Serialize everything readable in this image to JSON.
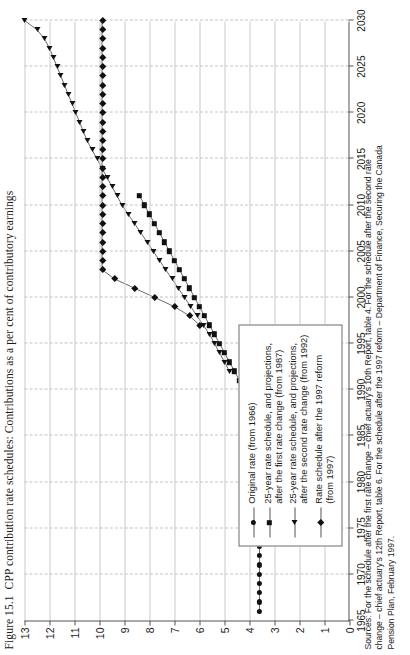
{
  "figure": {
    "number": "Figure 15.1",
    "title": "CPP contribution rate schedules: Contributions as a per cent of contributory earnings"
  },
  "sources": {
    "line1": "Sources: For the schedule after the first rate change – chief actuary's 10th Report, table 4. For the schedule after the second rate",
    "line2": "change – chief actuary's 12th Report, table 6. For the schedule after the 1997 reform – Department of Finance, Securing the Canada",
    "line3": "Pension Plan, February 1997."
  },
  "legend": {
    "items": [
      {
        "marker": "circle",
        "label": "Original rate (from 1966)"
      },
      {
        "marker": "square",
        "label": "25-year rate schedule, and projections,\nafter the first rate change (from 1987)"
      },
      {
        "marker": "triangle",
        "label": "25-year rate schedule, and projections,\nafter the second rate change (from 1992)"
      },
      {
        "marker": "diamond",
        "label": "Rate schedule after the 1997 reform\n(from 1997)"
      }
    ]
  },
  "chart_data": {
    "type": "line",
    "title": "CPP contribution rate schedules: Contributions as a per cent of contributory earnings",
    "xlabel": "",
    "ylabel": "",
    "xlim": [
      1965,
      2030
    ],
    "ylim": [
      0,
      13
    ],
    "xticks": [
      1965,
      1970,
      1975,
      1980,
      1985,
      1990,
      1995,
      2000,
      2005,
      2010,
      2015,
      2020,
      2025,
      2030
    ],
    "yticks": [
      0,
      1,
      2,
      3,
      4,
      5,
      6,
      7,
      8,
      9,
      10,
      11,
      12,
      13
    ],
    "grid": "both",
    "legend_position": "lower-left",
    "series": [
      {
        "name": "Original rate (from 1966)",
        "marker": "circle",
        "x": [
          1966,
          1967,
          1968,
          1969,
          1970,
          1971,
          1972,
          1973,
          1974,
          1975,
          1976,
          1977,
          1978,
          1979,
          1980,
          1981,
          1982,
          1983,
          1984,
          1985,
          1986
        ],
        "values": [
          3.6,
          3.6,
          3.6,
          3.6,
          3.6,
          3.6,
          3.6,
          3.6,
          3.6,
          3.6,
          3.6,
          3.6,
          3.6,
          3.6,
          3.6,
          3.6,
          3.6,
          3.6,
          3.6,
          3.6,
          3.6
        ]
      },
      {
        "name": "25-year rate schedule, and projections, after the first rate change (from 1987)",
        "marker": "square",
        "x": [
          1987,
          1988,
          1989,
          1990,
          1991,
          1992,
          1993,
          1994,
          1995,
          1996,
          1997,
          1998,
          1999,
          2000,
          2001,
          2002,
          2003,
          2004,
          2005,
          2006,
          2007,
          2008,
          2009,
          2010,
          2011
        ],
        "values": [
          3.8,
          3.8,
          4.0,
          4.2,
          4.4,
          4.6,
          4.8,
          5.0,
          5.2,
          5.4,
          5.6,
          5.8,
          6.0,
          6.2,
          6.4,
          6.6,
          6.8,
          7.0,
          7.2,
          7.4,
          7.6,
          7.8,
          8.0,
          8.2,
          8.4
        ]
      },
      {
        "name": "25-year rate schedule, and projections, after the second rate change (from 1992)",
        "marker": "triangle",
        "x": [
          1992,
          1993,
          1994,
          1995,
          1996,
          1997,
          1998,
          1999,
          2000,
          2001,
          2002,
          2003,
          2004,
          2005,
          2006,
          2007,
          2008,
          2009,
          2010,
          2011,
          2012,
          2013,
          2014,
          2015,
          2016,
          2017,
          2018,
          2019,
          2020,
          2021,
          2022,
          2023,
          2024,
          2025,
          2026,
          2027,
          2028,
          2029,
          2030
        ],
        "values": [
          4.8,
          5.0,
          5.2,
          5.4,
          5.6,
          5.85,
          6.1,
          6.35,
          6.6,
          6.85,
          7.1,
          7.35,
          7.6,
          7.85,
          8.1,
          8.35,
          8.6,
          8.85,
          9.1,
          9.3,
          9.5,
          9.7,
          9.9,
          10.1,
          10.3,
          10.5,
          10.65,
          10.8,
          10.95,
          11.1,
          11.25,
          11.4,
          11.55,
          11.7,
          11.85,
          12.0,
          12.2,
          12.5,
          13.0
        ]
      },
      {
        "name": "Rate schedule after the 1997 reform (from 1997)",
        "marker": "diamond",
        "x": [
          1997,
          1998,
          1999,
          2000,
          2001,
          2002,
          2003,
          2004,
          2005,
          2006,
          2007,
          2008,
          2009,
          2010,
          2011,
          2012,
          2013,
          2014,
          2015,
          2016,
          2017,
          2018,
          2019,
          2020,
          2021,
          2022,
          2023,
          2024,
          2025,
          2026,
          2027,
          2028,
          2029,
          2030
        ],
        "values": [
          6.0,
          6.4,
          7.0,
          7.8,
          8.6,
          9.4,
          9.9,
          9.9,
          9.9,
          9.9,
          9.9,
          9.9,
          9.9,
          9.9,
          9.9,
          9.9,
          9.9,
          9.9,
          9.9,
          9.9,
          9.9,
          9.9,
          9.9,
          9.9,
          9.9,
          9.9,
          9.9,
          9.9,
          9.9,
          9.9,
          9.9,
          9.9,
          9.9,
          9.9
        ]
      }
    ]
  }
}
